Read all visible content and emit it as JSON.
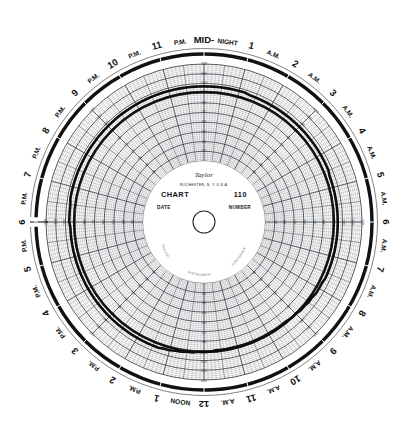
{
  "chart_data": {
    "type": "line",
    "subtype": "polar-circular-recorder-chart",
    "title": "CHART 110",
    "manufacturer": "Taylor",
    "manufacturer_location": "ROCHESTER, N.Y. U.S.A.",
    "chart_number": "110",
    "rotation_period_hours": 24,
    "time_origin_label": "6 P.M.",
    "time_direction": "clockwise",
    "xlabel": "Time of day (24 hour rotation)",
    "ylabel": "Scale reading",
    "grid": true,
    "legend_position": "none",
    "rlim": [
      20,
      120
    ],
    "r_major_step": 10,
    "r_minor_divisions": 5,
    "radial_tick_labels": [
      "120",
      "110",
      "100",
      "90",
      "80",
      "70",
      "60",
      "50",
      "40",
      "30",
      "20"
    ],
    "hour_labels": [
      "6 P.M.",
      "7 P.M.",
      "8 P.M.",
      "9 P.M.",
      "10 P.M.",
      "11 P.M.",
      "MID-NIGHT",
      "1 A.M.",
      "2 A.M.",
      "3 A.M.",
      "4 A.M.",
      "5 A.M.",
      "6 A.M.",
      "7 A.M.",
      "8 A.M.",
      "9 A.M.",
      "10 A.M.",
      "11 A.M.",
      "12 NOON",
      "1 P.M.",
      "2 P.M.",
      "3 P.M.",
      "4 P.M.",
      "5 P.M."
    ],
    "hour_numerals": [
      "6",
      "7",
      "8",
      "9",
      "10",
      "11",
      "MID-",
      "1",
      "2",
      "3",
      "4",
      "5",
      "6",
      "7",
      "8",
      "9",
      "10",
      "11",
      "12",
      "1",
      "2",
      "3",
      "4",
      "5"
    ],
    "hour_suffixes": [
      "P.M.",
      "P.M.",
      "P.M.",
      "P.M.",
      "P.M.",
      "P.M.",
      "NIGHT",
      "A.M.",
      "A.M.",
      "A.M.",
      "A.M.",
      "A.M.",
      "A.M.",
      "A.M.",
      "A.M.",
      "A.M.",
      "A.M.",
      "A.M.",
      "NOON",
      "P.M.",
      "P.M.",
      "P.M.",
      "P.M.",
      "P.M."
    ],
    "series": [
      {
        "name": "recorded pen trace",
        "color": "#101010",
        "closed": true,
        "comment": "values are scale readings sampled every 15 minutes starting at 6 P.M. going clockwise",
        "values": [
          96,
          96,
          96,
          96,
          97,
          97,
          97,
          97,
          97,
          97,
          97,
          97,
          97,
          97,
          97,
          97,
          97,
          97,
          97,
          97,
          97,
          97,
          97,
          97,
          97,
          97,
          97,
          97,
          97,
          97,
          97,
          97,
          97,
          97,
          97,
          97,
          97,
          97,
          97,
          97,
          97,
          97,
          97,
          97,
          96,
          96,
          96,
          96,
          96,
          96,
          96,
          96,
          96,
          96,
          96,
          96,
          96,
          96,
          96,
          96,
          96,
          96,
          96,
          96,
          95,
          95,
          95,
          95,
          95,
          95,
          95,
          95,
          95,
          95,
          95,
          95,
          95,
          95,
          95,
          95,
          95,
          95,
          95,
          94,
          94,
          94,
          93,
          93,
          92,
          92,
          91,
          91,
          90,
          90,
          90,
          90,
          90,
          90,
          90,
          90,
          90,
          90,
          90,
          90,
          90,
          90,
          90,
          91,
          91,
          91,
          92,
          92,
          93,
          93,
          94,
          94,
          95,
          95,
          95,
          95,
          95,
          95,
          95,
          95,
          95,
          95,
          95,
          95,
          95,
          95,
          95,
          95,
          95,
          95,
          95,
          95,
          95,
          95,
          95,
          95,
          95,
          95,
          95,
          95
        ]
      }
    ],
    "trace_events": [
      {
        "time": "6 P.M.",
        "type": "step-notch",
        "note": "pen offset step at chart start line"
      },
      {
        "time": "7 A.M.",
        "type": "step-notch",
        "note": "pen offset step"
      }
    ]
  },
  "hub": {
    "brand": "Taylor",
    "city_line": "ROCHESTER, N. Y. U.S.A.",
    "chart_word": "CHART",
    "chart_number": "110",
    "date_word": "DATE",
    "number_word": "NUMBER",
    "arc_left": "TAYLOR",
    "arc_mid": "INSTRUMENT",
    "arc_right": "COMPANIES"
  },
  "rim": {
    "hours": [
      {
        "numeral": "6",
        "suffix": "P.M.",
        "angle": 180
      },
      {
        "numeral": "7",
        "suffix": "P.M.",
        "angle": 195
      },
      {
        "numeral": "8",
        "suffix": "P.M.",
        "angle": 210
      },
      {
        "numeral": "9",
        "suffix": "P.M.",
        "angle": 225
      },
      {
        "numeral": "10",
        "suffix": "P.M.",
        "angle": 240
      },
      {
        "numeral": "11",
        "suffix": "P.M.",
        "angle": 255
      },
      {
        "numeral": "MID-",
        "suffix": "NIGHT",
        "angle": 270
      },
      {
        "numeral": "1",
        "suffix": "A.M.",
        "angle": 285
      },
      {
        "numeral": "2",
        "suffix": "A.M.",
        "angle": 300
      },
      {
        "numeral": "3",
        "suffix": "A.M.",
        "angle": 315
      },
      {
        "numeral": "4",
        "suffix": "A.M.",
        "angle": 330
      },
      {
        "numeral": "5",
        "suffix": "A.M.",
        "angle": 345
      },
      {
        "numeral": "6",
        "suffix": "A.M.",
        "angle": 0
      },
      {
        "numeral": "7",
        "suffix": "A.M.",
        "angle": 15
      },
      {
        "numeral": "8",
        "suffix": "A.M.",
        "angle": 30
      },
      {
        "numeral": "9",
        "suffix": "A.M.",
        "angle": 45
      },
      {
        "numeral": "10",
        "suffix": "A.M.",
        "angle": 60
      },
      {
        "numeral": "11",
        "suffix": "A.M.",
        "angle": 75
      },
      {
        "numeral": "12",
        "suffix": "NOON",
        "angle": 90
      },
      {
        "numeral": "1",
        "suffix": "P.M.",
        "angle": 105
      },
      {
        "numeral": "2",
        "suffix": "P.M.",
        "angle": 120
      },
      {
        "numeral": "3",
        "suffix": "P.M.",
        "angle": 135
      },
      {
        "numeral": "4",
        "suffix": "P.M.",
        "angle": 150
      },
      {
        "numeral": "5",
        "suffix": "P.M.",
        "angle": 165
      }
    ]
  },
  "radial_scale": {
    "labels": [
      "120",
      "110",
      "100",
      "90",
      "80",
      "70",
      "60",
      "50",
      "40",
      "30"
    ],
    "label_spokes_deg": [
      270,
      90,
      0,
      180,
      315,
      135,
      45,
      225
    ]
  },
  "colors": {
    "paper": "#ffffff",
    "ink": "#101010",
    "grid_fine": "#8d9197",
    "grid_major": "#3c4046",
    "trace": "#0d0d0d",
    "rim_band": "#111111",
    "hub_text": "#14161a"
  }
}
